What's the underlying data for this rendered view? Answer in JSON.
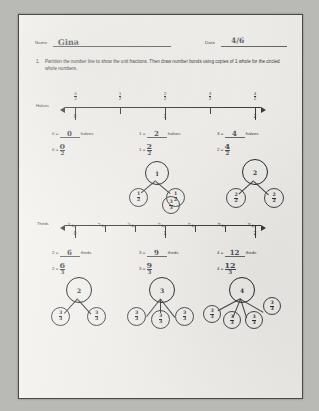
{
  "header": {
    "name_label": "Name",
    "name_value": "Gina",
    "date_label": "Date",
    "date_value": "4/6"
  },
  "problem": {
    "number": "1.",
    "text": "Partition the number line to show the unit fractions.  Then draw number bonds using copies of 1 whole for the circled whole numbers."
  },
  "halves_line": {
    "row_label": "Halves",
    "fraction_labels": [
      "0/2",
      "1/2",
      "2/2",
      "3/2",
      "4/2"
    ],
    "whole_labels": [
      "0",
      "1",
      "2"
    ],
    "statements": [
      {
        "whole": "0",
        "eq": "=",
        "answer": "0",
        "unit": "halves"
      },
      {
        "whole": "1",
        "eq": "=",
        "answer": "2",
        "unit": "halves"
      },
      {
        "whole": "3",
        "eq": "=",
        "answer": "4",
        "unit": "halves"
      }
    ],
    "equations": [
      {
        "left": "0",
        "eq": "=",
        "num": "0",
        "den": "2"
      },
      {
        "left": "1",
        "eq": "=",
        "num": "2",
        "den": "2"
      },
      {
        "left": "2",
        "eq": "=",
        "num": "4",
        "den": "2"
      }
    ],
    "bonds": [
      {
        "total": "1",
        "parts": [
          {
            "num": "1",
            "den": "2"
          },
          {
            "num": "1",
            "den": "2"
          }
        ]
      },
      {
        "total": "2",
        "parts": [
          {
            "num": "2",
            "den": "2"
          },
          {
            "num": "2",
            "den": "2"
          }
        ]
      }
    ]
  },
  "thirds_line": {
    "row_label": "Thirds",
    "fraction_labels": [
      "0/3",
      "1/3",
      "2/3",
      "3/3",
      "4/3",
      "5/3",
      "6/3"
    ],
    "whole_labels": [
      "0",
      "1",
      "2"
    ],
    "statements": [
      {
        "whole": "2",
        "eq": "=",
        "answer": "6",
        "unit": "thirds"
      },
      {
        "whole": "3",
        "eq": "=",
        "answer": "9",
        "unit": "thirds"
      },
      {
        "whole": "4",
        "eq": "=",
        "answer": "12",
        "unit": "thirds"
      }
    ],
    "equations": [
      {
        "left": "2",
        "eq": "=",
        "num": "6",
        "den": "3"
      },
      {
        "left": "3",
        "eq": "=",
        "num": "9",
        "den": "3"
      },
      {
        "left": "4",
        "eq": "=",
        "num": "12",
        "den": "3"
      }
    ],
    "bonds": [
      {
        "total": "2",
        "parts": [
          {
            "num": "3",
            "den": "3"
          },
          {
            "num": "3",
            "den": "3"
          }
        ]
      },
      {
        "total": "3",
        "parts": [
          {
            "num": "3",
            "den": "3"
          },
          {
            "num": "3",
            "den": "3"
          },
          {
            "num": "3",
            "den": "3"
          }
        ]
      },
      {
        "total": "4",
        "parts": [
          {
            "num": "3",
            "den": "3"
          },
          {
            "num": "3",
            "den": "3"
          },
          {
            "num": "3",
            "den": "3"
          },
          {
            "num": "3",
            "den": "3"
          }
        ]
      }
    ]
  }
}
